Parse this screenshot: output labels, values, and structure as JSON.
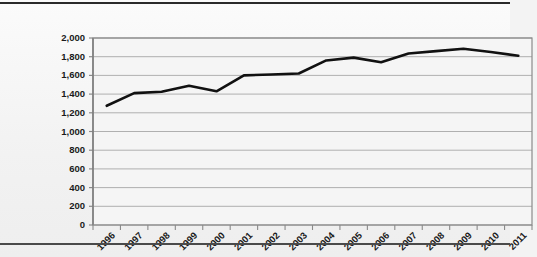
{
  "chart_data": {
    "type": "line",
    "title": "",
    "xlabel": "",
    "ylabel": "",
    "categories": [
      "1996",
      "1997",
      "1998",
      "1999",
      "2000",
      "2001",
      "2002",
      "2003",
      "2004",
      "2005",
      "2006",
      "2007",
      "2008",
      "2009",
      "2010",
      "2011"
    ],
    "values": [
      1275,
      1410,
      1425,
      1490,
      1430,
      1600,
      1610,
      1620,
      1760,
      1790,
      1740,
      1835,
      1860,
      1885,
      1850,
      1810
    ],
    "series": [
      {
        "name": "Series 1",
        "values": [
          1275,
          1410,
          1425,
          1490,
          1430,
          1600,
          1610,
          1620,
          1760,
          1790,
          1740,
          1835,
          1860,
          1885,
          1850,
          1810
        ]
      }
    ],
    "ylim": [
      0,
      2000
    ],
    "ytick_values": [
      0,
      200,
      400,
      600,
      800,
      1000,
      1200,
      1400,
      1600,
      1800,
      2000
    ],
    "ytick_labels": [
      "0",
      "200",
      "400",
      "600",
      "800",
      "1,000",
      "1,200",
      "1,400",
      "1,600",
      "1,800",
      "2,000"
    ],
    "xtick_labels": [
      "1996",
      "1997",
      "1998",
      "1999",
      "2000",
      "2001",
      "2002",
      "2003",
      "2004",
      "2005",
      "2006",
      "2007",
      "2008",
      "2009",
      "2010",
      "2011"
    ],
    "grid": true,
    "grid_axis": "y",
    "legend": false,
    "legend_position": "none",
    "line_color": "#111111",
    "grid_color": "#a8a8a8",
    "axis_color": "#8a8a8a",
    "plot_background": "#f5f5f5",
    "annotations": []
  },
  "page": {
    "background_color": "#f2f2f2",
    "rule_color_top": "#2b2b2b",
    "rule_color_bottom": "#4a4a4a"
  }
}
